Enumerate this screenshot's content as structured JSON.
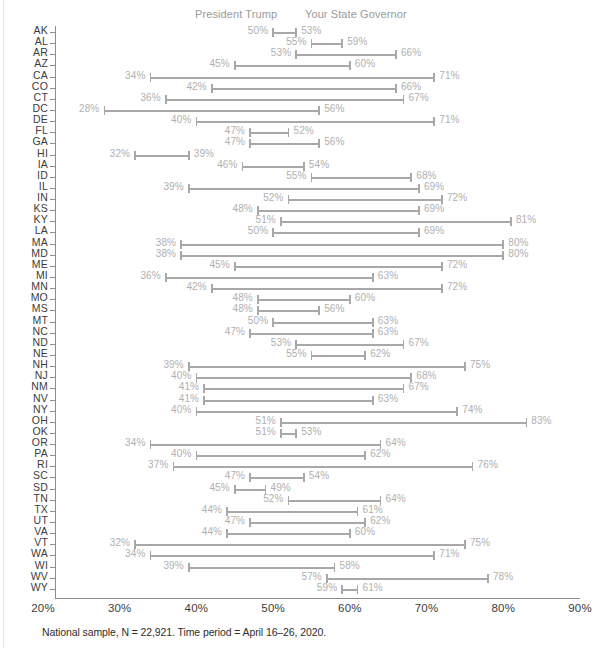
{
  "legend": {
    "trump": "President Trump",
    "governor": "Your State Governor"
  },
  "footnote": "National sample, N = 22,921. Time period = April 16–26, 2020.",
  "axis": {
    "ticks": [
      "20%",
      "30%",
      "40%",
      "50%",
      "60%",
      "70%",
      "80%",
      "90%"
    ]
  },
  "colors": {
    "bar": "#a8a8a8",
    "value_label": "#b0b0b0",
    "axis": "#8d8d8d",
    "state_label": "#3c3c3c",
    "legend_label": "#9a9a9a",
    "background": "#ffffff"
  },
  "chart_data": {
    "type": "bar",
    "subtype": "dumbbell",
    "title": "",
    "xlabel": "",
    "ylabel": "",
    "xlim": [
      20,
      90
    ],
    "grid": false,
    "legend_position": "top",
    "series": [
      {
        "name": "President Trump",
        "key": "trump"
      },
      {
        "name": "Your State Governor",
        "key": "governor"
      }
    ],
    "categories": [
      "AK",
      "AL",
      "AR",
      "AZ",
      "CA",
      "CO",
      "CT",
      "DC",
      "DE",
      "FL",
      "GA",
      "HI",
      "IA",
      "ID",
      "IL",
      "IN",
      "KS",
      "KY",
      "LA",
      "MA",
      "MD",
      "ME",
      "MI",
      "MN",
      "MO",
      "MS",
      "MT",
      "NC",
      "ND",
      "NE",
      "NH",
      "NJ",
      "NM",
      "NV",
      "NY",
      "OH",
      "OK",
      "OR",
      "PA",
      "RI",
      "SC",
      "SD",
      "TN",
      "TX",
      "UT",
      "VA",
      "VT",
      "WA",
      "WI",
      "WV",
      "WY"
    ],
    "rows": [
      {
        "state": "AK",
        "trump": 50,
        "governor": 53,
        "trump_label": "50%",
        "governor_label": "53%"
      },
      {
        "state": "AL",
        "trump": 55,
        "governor": 59,
        "trump_label": "55%",
        "governor_label": "59%"
      },
      {
        "state": "AR",
        "trump": 53,
        "governor": 66,
        "trump_label": "53%",
        "governor_label": "66%"
      },
      {
        "state": "AZ",
        "trump": 45,
        "governor": 60,
        "trump_label": "45%",
        "governor_label": "60%"
      },
      {
        "state": "CA",
        "trump": 34,
        "governor": 71,
        "trump_label": "34%",
        "governor_label": "71%"
      },
      {
        "state": "CO",
        "trump": 42,
        "governor": 66,
        "trump_label": "42%",
        "governor_label": "66%"
      },
      {
        "state": "CT",
        "trump": 36,
        "governor": 67,
        "trump_label": "36%",
        "governor_label": "67%"
      },
      {
        "state": "DC",
        "trump": 28,
        "governor": 56,
        "trump_label": "28%",
        "governor_label": "56%"
      },
      {
        "state": "DE",
        "trump": 40,
        "governor": 71,
        "trump_label": "40%",
        "governor_label": "71%"
      },
      {
        "state": "FL",
        "trump": 47,
        "governor": 52,
        "trump_label": "47%",
        "governor_label": "52%"
      },
      {
        "state": "GA",
        "trump": 47,
        "governor": 56,
        "trump_label": "47%",
        "governor_label": "56%"
      },
      {
        "state": "HI",
        "trump": 32,
        "governor": 39,
        "trump_label": "32%",
        "governor_label": "39%"
      },
      {
        "state": "IA",
        "trump": 46,
        "governor": 54,
        "trump_label": "46%",
        "governor_label": "54%"
      },
      {
        "state": "ID",
        "trump": 55,
        "governor": 68,
        "trump_label": "55%",
        "governor_label": "68%"
      },
      {
        "state": "IL",
        "trump": 39,
        "governor": 69,
        "trump_label": "39%",
        "governor_label": "69%"
      },
      {
        "state": "IN",
        "trump": 52,
        "governor": 72,
        "trump_label": "52%",
        "governor_label": "72%"
      },
      {
        "state": "KS",
        "trump": 48,
        "governor": 69,
        "trump_label": "48%",
        "governor_label": "69%"
      },
      {
        "state": "KY",
        "trump": 51,
        "governor": 81,
        "trump_label": "51%",
        "governor_label": "81%"
      },
      {
        "state": "LA",
        "trump": 50,
        "governor": 69,
        "trump_label": "50%",
        "governor_label": "69%"
      },
      {
        "state": "MA",
        "trump": 38,
        "governor": 80,
        "trump_label": "38%",
        "governor_label": "80%"
      },
      {
        "state": "MD",
        "trump": 38,
        "governor": 80,
        "trump_label": "38%",
        "governor_label": "80%"
      },
      {
        "state": "ME",
        "trump": 45,
        "governor": 72,
        "trump_label": "45%",
        "governor_label": "72%"
      },
      {
        "state": "MI",
        "trump": 36,
        "governor": 63,
        "trump_label": "36%",
        "governor_label": "63%"
      },
      {
        "state": "MN",
        "trump": 42,
        "governor": 72,
        "trump_label": "42%",
        "governor_label": "72%"
      },
      {
        "state": "MO",
        "trump": 48,
        "governor": 60,
        "trump_label": "48%",
        "governor_label": "60%"
      },
      {
        "state": "MS",
        "trump": 48,
        "governor": 56,
        "trump_label": "48%",
        "governor_label": "56%"
      },
      {
        "state": "MT",
        "trump": 50,
        "governor": 63,
        "trump_label": "50%",
        "governor_label": "63%"
      },
      {
        "state": "NC",
        "trump": 47,
        "governor": 63,
        "trump_label": "47%",
        "governor_label": "63%"
      },
      {
        "state": "ND",
        "trump": 53,
        "governor": 67,
        "trump_label": "53%",
        "governor_label": "67%"
      },
      {
        "state": "NE",
        "trump": 55,
        "governor": 62,
        "trump_label": "55%",
        "governor_label": "62%"
      },
      {
        "state": "NH",
        "trump": 39,
        "governor": 75,
        "trump_label": "39%",
        "governor_label": "75%"
      },
      {
        "state": "NJ",
        "trump": 40,
        "governor": 68,
        "trump_label": "40%",
        "governor_label": "68%"
      },
      {
        "state": "NM",
        "trump": 41,
        "governor": 67,
        "trump_label": "41%",
        "governor_label": "67%"
      },
      {
        "state": "NV",
        "trump": 41,
        "governor": 63,
        "trump_label": "41%",
        "governor_label": "63%"
      },
      {
        "state": "NY",
        "trump": 40,
        "governor": 74,
        "trump_label": "40%",
        "governor_label": "74%"
      },
      {
        "state": "OH",
        "trump": 51,
        "governor": 83,
        "trump_label": "51%",
        "governor_label": "83%"
      },
      {
        "state": "OK",
        "trump": 51,
        "governor": 53,
        "trump_label": "51%",
        "governor_label": "53%"
      },
      {
        "state": "OR",
        "trump": 34,
        "governor": 64,
        "trump_label": "34%",
        "governor_label": "64%"
      },
      {
        "state": "PA",
        "trump": 40,
        "governor": 62,
        "trump_label": "40%",
        "governor_label": "62%"
      },
      {
        "state": "RI",
        "trump": 37,
        "governor": 76,
        "trump_label": "37%",
        "governor_label": "76%"
      },
      {
        "state": "SC",
        "trump": 47,
        "governor": 54,
        "trump_label": "47%",
        "governor_label": "54%"
      },
      {
        "state": "SD",
        "trump": 45,
        "governor": 49,
        "trump_label": "45%",
        "governor_label": "49%"
      },
      {
        "state": "TN",
        "trump": 52,
        "governor": 64,
        "trump_label": "52%",
        "governor_label": "64%"
      },
      {
        "state": "TX",
        "trump": 44,
        "governor": 61,
        "trump_label": "44%",
        "governor_label": "61%"
      },
      {
        "state": "UT",
        "trump": 47,
        "governor": 62,
        "trump_label": "47%",
        "governor_label": "62%"
      },
      {
        "state": "VA",
        "trump": 44,
        "governor": 60,
        "trump_label": "44%",
        "governor_label": "60%"
      },
      {
        "state": "VT",
        "trump": 32,
        "governor": 75,
        "trump_label": "32%",
        "governor_label": "75%"
      },
      {
        "state": "WA",
        "trump": 34,
        "governor": 71,
        "trump_label": "34%",
        "governor_label": "71%"
      },
      {
        "state": "WI",
        "trump": 39,
        "governor": 58,
        "trump_label": "39%",
        "governor_label": "58%"
      },
      {
        "state": "WV",
        "trump": 57,
        "governor": 78,
        "trump_label": "57%",
        "governor_label": "78%"
      },
      {
        "state": "WY",
        "trump": 59,
        "governor": 61,
        "trump_label": "59%",
        "governor_label": "61%"
      }
    ]
  }
}
